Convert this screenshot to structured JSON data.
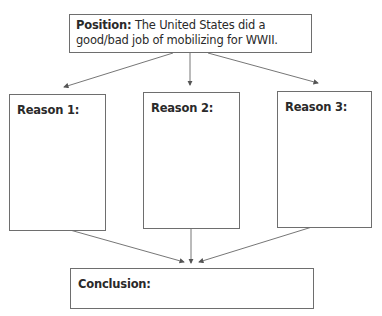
{
  "position": {
    "label": "Position:",
    "text": " The United States did a good/bad job of mobilizing for WWII."
  },
  "reasons": [
    {
      "label": "Reason 1:"
    },
    {
      "label": "Reason 2:"
    },
    {
      "label": "Reason 3:"
    }
  ],
  "conclusion": {
    "label": "Conclusion:"
  },
  "colors": {
    "border": "#6e6e6e",
    "text": "#2a2a2a",
    "arrow": "#555555"
  }
}
